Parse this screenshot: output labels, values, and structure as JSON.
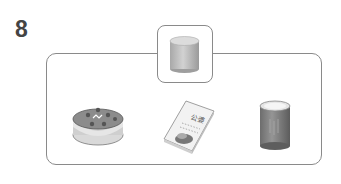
{
  "question": {
    "number": "8",
    "reference_item": {
      "name": "cylinder",
      "color": "#b5b5b5"
    },
    "options": [
      {
        "name": "cake",
        "color": "#8a8a8a"
      },
      {
        "name": "book",
        "color": "#e0e0e0"
      },
      {
        "name": "can",
        "color": "#7f7f7f"
      }
    ]
  }
}
